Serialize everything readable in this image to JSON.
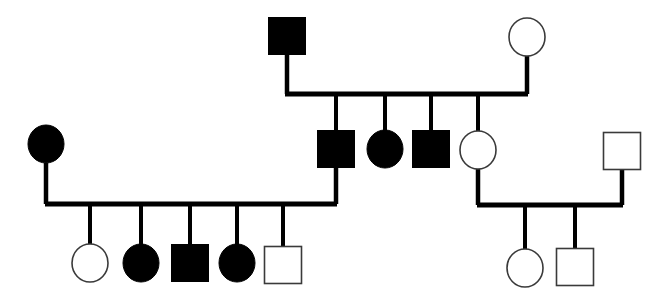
{
  "figure": {
    "kind": "pedigree-chart",
    "width": 666,
    "height": 304,
    "background_color": "#ffffff",
    "line_color": "#000000",
    "filled_symbol_color": "#000000",
    "open_symbol_fill": "#ffffff",
    "open_symbol_stroke": "#3a3a3a",
    "legend_note": "Filled symbol = affected; open symbol = unaffected; square = male; circle = female"
  },
  "individuals": [
    {
      "id": "I-1",
      "generation": 1,
      "sex": "male",
      "shape": "square",
      "affected": true,
      "fill": "#000000",
      "x": 287,
      "y": 36,
      "size": 37
    },
    {
      "id": "I-2",
      "generation": 1,
      "sex": "female",
      "shape": "circle",
      "affected": false,
      "fill": "#ffffff",
      "x": 527,
      "y": 37,
      "rx": 18,
      "ry": 19
    },
    {
      "id": "II-1",
      "generation": 2,
      "sex": "female",
      "shape": "circle",
      "affected": true,
      "fill": "#000000",
      "x": 46,
      "y": 144,
      "rx": 18,
      "ry": 19
    },
    {
      "id": "II-2",
      "generation": 2,
      "sex": "male",
      "shape": "square",
      "affected": true,
      "fill": "#000000",
      "x": 336,
      "y": 149,
      "size": 37
    },
    {
      "id": "II-3",
      "generation": 2,
      "sex": "female",
      "shape": "circle",
      "affected": true,
      "fill": "#000000",
      "x": 385,
      "y": 149,
      "rx": 18,
      "ry": 19
    },
    {
      "id": "II-4",
      "generation": 2,
      "sex": "male",
      "shape": "square",
      "affected": true,
      "fill": "#000000",
      "x": 431,
      "y": 149,
      "size": 37
    },
    {
      "id": "II-5",
      "generation": 2,
      "sex": "female",
      "shape": "circle",
      "affected": false,
      "fill": "#ffffff",
      "x": 478,
      "y": 150,
      "rx": 18,
      "ry": 19
    },
    {
      "id": "II-6",
      "generation": 2,
      "sex": "male",
      "shape": "square",
      "affected": false,
      "fill": "#ffffff",
      "x": 622,
      "y": 151,
      "size": 37
    },
    {
      "id": "III-1",
      "generation": 3,
      "sex": "female",
      "shape": "circle",
      "affected": false,
      "fill": "#ffffff",
      "x": 90,
      "y": 263,
      "rx": 18,
      "ry": 19
    },
    {
      "id": "III-2",
      "generation": 3,
      "sex": "female",
      "shape": "circle",
      "affected": true,
      "fill": "#000000",
      "x": 141,
      "y": 263,
      "rx": 18,
      "ry": 19
    },
    {
      "id": "III-3",
      "generation": 3,
      "sex": "male",
      "shape": "square",
      "affected": true,
      "fill": "#000000",
      "x": 190,
      "y": 263,
      "size": 37
    },
    {
      "id": "III-4",
      "generation": 3,
      "sex": "female",
      "shape": "circle",
      "affected": true,
      "fill": "#000000",
      "x": 237,
      "y": 263,
      "rx": 18,
      "ry": 19
    },
    {
      "id": "III-5",
      "generation": 3,
      "sex": "male",
      "shape": "square",
      "affected": false,
      "fill": "#ffffff",
      "x": 283,
      "y": 265,
      "size": 37
    },
    {
      "id": "III-6",
      "generation": 3,
      "sex": "female",
      "shape": "circle",
      "affected": false,
      "fill": "#ffffff",
      "x": 525,
      "y": 268,
      "rx": 18,
      "ry": 19
    },
    {
      "id": "III-7",
      "generation": 3,
      "sex": "male",
      "shape": "square",
      "affected": false,
      "fill": "#ffffff",
      "x": 575,
      "y": 267,
      "size": 37
    }
  ],
  "connections": [
    {
      "id": "mating-I",
      "type": "mating",
      "partners": [
        "I-1",
        "I-2"
      ],
      "drop_left": {
        "x": 287,
        "y1": 55,
        "y2": 94
      },
      "drop_right": {
        "x": 527,
        "y1": 56,
        "y2": 94
      },
      "sibship_line": {
        "x1": 285,
        "x2": 528,
        "y": 94
      },
      "children": [
        "II-2",
        "II-3",
        "II-4",
        "II-5"
      ],
      "child_drops": [
        {
          "x": 336,
          "y1": 94,
          "y2": 131
        },
        {
          "x": 385,
          "y1": 94,
          "y2": 131
        },
        {
          "x": 431,
          "y1": 94,
          "y2": 131
        },
        {
          "x": 478,
          "y1": 94,
          "y2": 132
        }
      ]
    },
    {
      "id": "mating-II-left",
      "type": "mating",
      "partners": [
        "II-1",
        "II-2"
      ],
      "drop_left": {
        "x": 46,
        "y1": 163,
        "y2": 204
      },
      "drop_right": {
        "x": 336,
        "y1": 168,
        "y2": 204
      },
      "sibship_line": {
        "x1": 45,
        "x2": 337,
        "y": 204
      },
      "children": [
        "III-1",
        "III-2",
        "III-3",
        "III-4",
        "III-5"
      ],
      "child_drops": [
        {
          "x": 90,
          "y1": 204,
          "y2": 245
        },
        {
          "x": 141,
          "y1": 204,
          "y2": 245
        },
        {
          "x": 190,
          "y1": 204,
          "y2": 245
        },
        {
          "x": 237,
          "y1": 204,
          "y2": 245
        },
        {
          "x": 283,
          "y1": 204,
          "y2": 247
        }
      ]
    },
    {
      "id": "mating-II-right",
      "type": "mating",
      "partners": [
        "II-5",
        "II-6"
      ],
      "drop_left": {
        "x": 478,
        "y1": 169,
        "y2": 205
      },
      "drop_right": {
        "x": 622,
        "y1": 170,
        "y2": 205
      },
      "sibship_line": {
        "x1": 477,
        "x2": 623,
        "y": 205
      },
      "children": [
        "III-6",
        "III-7"
      ],
      "child_drops": [
        {
          "x": 525,
          "y1": 205,
          "y2": 250
        },
        {
          "x": 575,
          "y1": 205,
          "y2": 249
        }
      ]
    }
  ],
  "line_widths": {
    "mating_line": 5,
    "drop_line": 4.5,
    "child_drop_line": 4
  }
}
